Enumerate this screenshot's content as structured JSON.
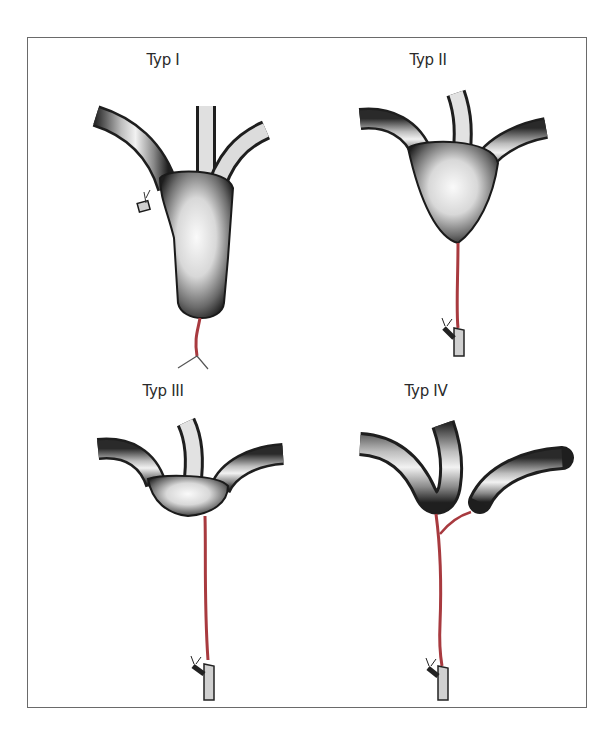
{
  "figure": {
    "panels": [
      {
        "id": "typ-1",
        "title": "Typ I"
      },
      {
        "id": "typ-2",
        "title": "Typ II"
      },
      {
        "id": "typ-3",
        "title": "Typ III"
      },
      {
        "id": "typ-4",
        "title": "Typ IV"
      }
    ],
    "colors": {
      "frame_border": "#6a6a6a",
      "duct_dark": "#1e1e1e",
      "duct_light": "#f4f4f4",
      "artery_red": "#a83a3f"
    }
  }
}
